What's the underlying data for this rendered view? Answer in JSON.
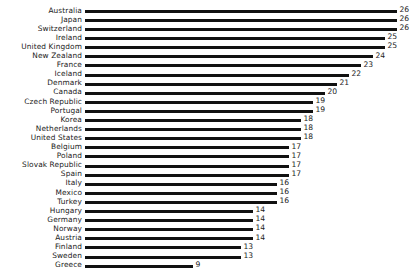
{
  "chart": {
    "title": "",
    "subtitle": "",
    "xlabel": "",
    "ylabel": "",
    "background_color": "#ffffff",
    "bar_color": "#111111",
    "text_color": "#1a1a1a"
  },
  "chart_data": {
    "type": "bar",
    "orientation": "horizontal",
    "title": "",
    "subtitle": "",
    "xlabel": "",
    "ylabel": "",
    "xlim": [
      0,
      26
    ],
    "grid": false,
    "legend": false,
    "data_labels": true,
    "categories": [
      "Australia",
      "Japan",
      "Switzerland",
      "Ireland",
      "United Kingdom",
      "New Zealand",
      "France",
      "Iceland",
      "Denmark",
      "Canada",
      "Czech Republic",
      "Portugal",
      "Korea",
      "Netherlands",
      "United States",
      "Belgium",
      "Poland",
      "Slovak Republic",
      "Spain",
      "Italy",
      "Mexico",
      "Turkey",
      "Hungary",
      "Germany",
      "Norway",
      "Austria",
      "Finland",
      "Sweden",
      "Greece"
    ],
    "values": [
      26,
      26,
      26,
      25,
      25,
      24,
      23,
      22,
      21,
      20,
      19,
      19,
      18,
      18,
      18,
      17,
      17,
      17,
      17,
      16,
      16,
      16,
      14,
      14,
      14,
      14,
      13,
      13,
      9
    ],
    "value_labels": [
      "26",
      "26",
      "26",
      "25",
      "25",
      "24",
      "23",
      "22",
      "21",
      "20",
      "19",
      "19",
      "18",
      "18",
      "18",
      "17",
      "17",
      "17",
      "17",
      "16",
      "16",
      "16",
      "14",
      "14",
      "14",
      "14",
      "13",
      "13",
      "9"
    ]
  }
}
